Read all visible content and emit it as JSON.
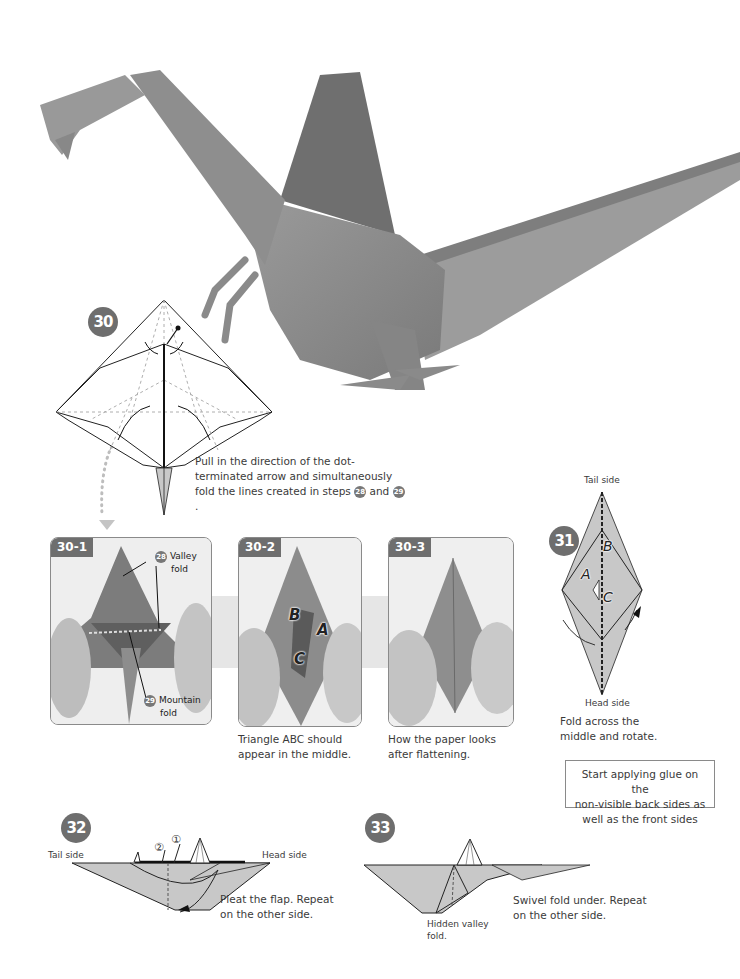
{
  "hero_photo": {
    "subject": "origami spinosaurus model",
    "paper_color": "#8f8f8f"
  },
  "steps": {
    "s30": {
      "number": "30",
      "caption_pre": "Pull in the direction of the dot-terminated arrow and simultaneously fold the lines created in steps ",
      "ref_a": "28",
      "caption_mid": " and ",
      "ref_b": "29",
      "caption_post": "."
    },
    "s30_1": {
      "tag": "30-1",
      "callout_top_ref": "28",
      "callout_top_label_1": "Valley",
      "callout_top_label_2": "fold",
      "callout_bottom_ref": "29",
      "callout_bottom_label_1": "Mountain",
      "callout_bottom_label_2": "fold"
    },
    "s30_2": {
      "tag": "30-2",
      "label_a": "A",
      "label_b": "B",
      "label_c": "C",
      "caption_1": "Triangle ABC should",
      "caption_2": "appear in the middle."
    },
    "s30_3": {
      "tag": "30-3",
      "caption_1": "How the paper looks",
      "caption_2": "after flattening."
    },
    "s31": {
      "number": "31",
      "top_label": "Tail side",
      "bottom_label": "Head side",
      "label_a": "A",
      "label_b": "B",
      "label_c": "C",
      "caption_1": "Fold across the",
      "caption_2": "middle and rotate."
    },
    "note": {
      "line_1": "Start applying glue on the",
      "line_2": "non-visible back sides as",
      "line_3": "well as the front sides"
    },
    "s32": {
      "number": "32",
      "left_label": "Tail side",
      "right_label": "Head side",
      "marker_1": "①",
      "marker_2": "②",
      "caption_1": "Pleat the flap. Repeat",
      "caption_2": "on the other side."
    },
    "s33": {
      "number": "33",
      "hidden_label_1": "Hidden valley",
      "hidden_label_2": "fold.",
      "caption_1": "Swivel fold under. Repeat",
      "caption_2": "on the other side."
    }
  },
  "colors": {
    "badge": "#6e6e6e",
    "diagram_fill": "#c8c8c8",
    "band": "#e6e6e6"
  }
}
